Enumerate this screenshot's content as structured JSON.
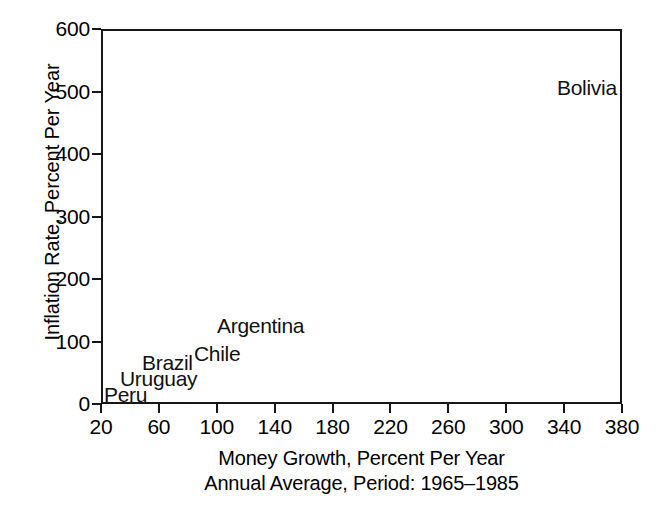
{
  "chart_data": {
    "type": "scatter",
    "title": "",
    "xlabel": "Money Growth, Percent Per Year",
    "xlabel_sub": "Annual Average, Period: 1965–1985",
    "ylabel": "Inflation Rate, Percent Per Year",
    "xlim": [
      20,
      380
    ],
    "ylim": [
      0,
      600
    ],
    "xticks": [
      20,
      60,
      100,
      140,
      180,
      220,
      260,
      300,
      340,
      380
    ],
    "yticks": [
      0,
      100,
      200,
      300,
      400,
      500,
      600
    ],
    "xtick_labels": [
      "20",
      "60",
      "100",
      "140",
      "180",
      "220",
      "260",
      "300",
      "340",
      "380"
    ],
    "ytick_labels": [
      "0",
      "100",
      "200",
      "300",
      "400",
      "500",
      "600"
    ],
    "grid": false,
    "legend": false,
    "marker_style": "text-label-only",
    "point_color": "#111111",
    "frame_color": "#161616",
    "background": "#ffffff",
    "points": [
      {
        "label": "Peru",
        "x": 24,
        "y": 32,
        "label_anchor": "left",
        "label_px_x": 102,
        "label_px_y": 382
      },
      {
        "label": "Uruguay",
        "x": 47,
        "y": 58,
        "label_anchor": "left",
        "label_px_x": 118,
        "label_px_y": 366
      },
      {
        "label": "Brazil",
        "x": 70,
        "y": 82,
        "label_anchor": "left",
        "label_px_x": 140,
        "label_px_y": 350
      },
      {
        "label": "Chile",
        "x": 91,
        "y": 98,
        "label_anchor": "left",
        "label_px_x": 192,
        "label_px_y": 341
      },
      {
        "label": "Argentina",
        "x": 122,
        "y": 132,
        "label_anchor": "left",
        "label_px_x": 215,
        "label_px_y": 313
      },
      {
        "label": "Bolivia",
        "x": 355,
        "y": 512,
        "label_anchor": "right",
        "label_px_x": 555,
        "label_px_y": 75
      }
    ]
  },
  "figure": {
    "caption_lines": [
      "Money Growth, Percent Per Year",
      "Annual Average, Period: 1965–1985"
    ]
  }
}
